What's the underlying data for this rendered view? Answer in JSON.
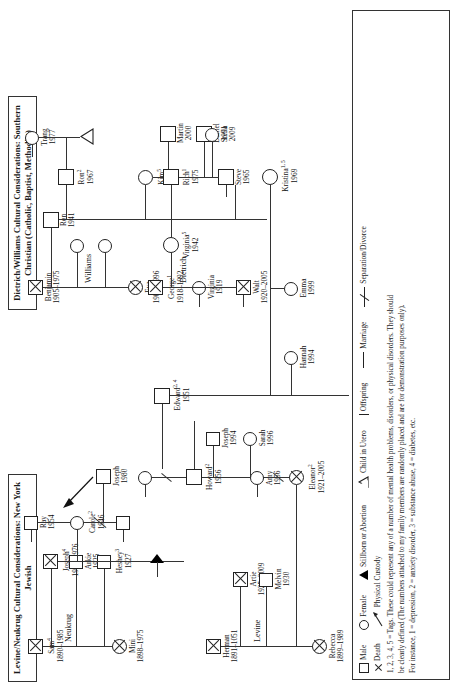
{
  "figure": {
    "type": "genogram",
    "orientation": "landscape-rotated-90ccw",
    "titles": {
      "jewish": "Levine/Neukrug Cultural Considerations: New York Jewish",
      "christian_line1": "Dietrich/Williams Cultural Considerations: Southern",
      "christian_line2": "Christian (Catholic, Baptist, Methodist)"
    }
  },
  "legend": {
    "items": [
      {
        "icon": "square-icon",
        "label": "Male"
      },
      {
        "icon": "circle-icon",
        "label": "Female"
      },
      {
        "icon": "filled-triangle-icon",
        "label": "Stillborn or Abortion"
      },
      {
        "icon": "open-triangle-icon",
        "label": "Child in Utero"
      },
      {
        "icon": "vertical-bar-icon",
        "label": "Offspring"
      },
      {
        "icon": "horizontal-line-icon",
        "label": "Marriage"
      },
      {
        "icon": "x-icon",
        "label": "Death"
      },
      {
        "icon": "arrow-icon",
        "label": "Physical Custody"
      },
      {
        "icon": "slashed-line-icon",
        "label": "Separation/Divorce"
      }
    ],
    "note_line1": "1, 2, 3, 4, 5 = Tags. These could represent any of a number of mental health problems, disorders, or physical disorders. They should",
    "note_line2": "be clearly defined (The numbers attached to my family members are randomly placed and are for demonstration purposes only).",
    "note_line3": "For instance, 1 = depression, 2 = anxiety disorder, 3 = substance abuse, 4 = diabetes, etc."
  },
  "families": {
    "neukrug": {
      "label": "Neukrug"
    },
    "levine": {
      "label": "Levine"
    },
    "williams": {
      "label": "Williams"
    },
    "dietrich": {
      "label": "Dietrich"
    }
  },
  "people": {
    "sam": {
      "name": "Sam",
      "tags": "4",
      "years": "1890–1985",
      "sex": "male",
      "dead": true
    },
    "mini": {
      "name": "Mini",
      "tags": "",
      "years": "1898–1975",
      "sex": "female",
      "dead": true
    },
    "arkie": {
      "name": "Arkie",
      "tags": "",
      "years": "1925",
      "sex": "male",
      "dead": false
    },
    "heshey": {
      "name": "Heshey",
      "tags": "3",
      "years": "1927",
      "sex": "male",
      "dead": false
    },
    "joseph_sr": {
      "name": "Joseph",
      "tags": "4",
      "years": "1919–1976",
      "sex": "male",
      "dead": true
    },
    "ray": {
      "name": "Ray",
      "tags": "",
      "years": "1954",
      "sex": "male",
      "dead": false
    },
    "carole": {
      "name": "Carole",
      "tags": "2",
      "years": "1946",
      "sex": "female",
      "dead": false
    },
    "joseph_jr": {
      "name": "Joseph",
      "tags": "",
      "years": "1980",
      "sex": "male",
      "dead": false
    },
    "herman": {
      "name": "Herman",
      "tags": "",
      "years": "1891–1051",
      "sex": "male",
      "dead": true
    },
    "rebecca": {
      "name": "Rebecca",
      "tags": "",
      "years": "1899–1989",
      "sex": "female",
      "dead": true
    },
    "artie": {
      "name": "Artie",
      "tags": "",
      "years": "1925–2009",
      "sex": "male",
      "dead": true
    },
    "melvin": {
      "name": "Melvin",
      "tags": "",
      "years": "1930",
      "sex": "male",
      "dead": false
    },
    "eleanor": {
      "name": "Eleanor",
      "tags": "2",
      "years": "1921–2005",
      "sex": "female",
      "dead": true
    },
    "howard": {
      "name": "Howard",
      "tags": "2",
      "years": "1956",
      "sex": "male",
      "dead": false
    },
    "amy": {
      "name": "Amy",
      "tags": "",
      "years": "1956",
      "sex": "female",
      "dead": false
    },
    "joseph94": {
      "name": "Joseph",
      "tags": "",
      "years": "1994",
      "sex": "male",
      "dead": false
    },
    "sarah": {
      "name": "Sarah",
      "tags": "",
      "years": "1996",
      "sex": "female",
      "dead": false
    },
    "edward": {
      "name": "Edward",
      "tags": "2, 4",
      "years": "1951",
      "sex": "male",
      "dead": false
    },
    "hannah": {
      "name": "Hannah",
      "tags": "",
      "years": "1994",
      "sex": "female",
      "dead": false
    },
    "benjamin": {
      "name": "Benjamin",
      "tags": "",
      "years": "1905–1975",
      "sex": "male",
      "dead": true
    },
    "eva": {
      "name": "Eva",
      "tags": "",
      "years": "1908–1996",
      "sex": "female",
      "dead": true
    },
    "ron": {
      "name": "Ron",
      "tags": "",
      "years": "1941",
      "sex": "male",
      "dead": false
    },
    "ron2": {
      "name": "Ron",
      "tags": "2",
      "years": "1967",
      "sex": "male",
      "dead": false
    },
    "trang": {
      "name": "Trang",
      "tags": "",
      "years": "1977",
      "sex": "female",
      "dead": false
    },
    "kim": {
      "name": "Kim",
      "tags": "5",
      "years": "1965",
      "sex": "female",
      "dead": false
    },
    "steve": {
      "name": "Steve",
      "tags": "",
      "years": "1965",
      "sex": "male",
      "dead": false
    },
    "martin": {
      "name": "Martin",
      "tags": "",
      "years": "2000",
      "sex": "male",
      "dead": false
    },
    "daniel": {
      "name": "Daniel",
      "tags": "",
      "years": "1991",
      "sex": "male",
      "dead": false
    },
    "kristina": {
      "name": "Kristina",
      "tags": "1, 5",
      "years": "1969",
      "sex": "female",
      "dead": false
    },
    "emma": {
      "name": "Emma",
      "tags": "",
      "years": "1999",
      "sex": "female",
      "dead": false
    },
    "walt": {
      "name": "Walt",
      "tags": "",
      "years": "1920–2005",
      "sex": "male",
      "dead": true
    },
    "virginia": {
      "name": "Virginia",
      "tags": "",
      "years": "1919",
      "sex": "female",
      "dead": false
    },
    "george": {
      "name": "George",
      "tags": "1",
      "years": "1918–1992",
      "sex": "male",
      "dead": true
    },
    "virginia5": {
      "name": "Virginia",
      "tags": "5",
      "years": "1942",
      "sex": "female",
      "dead": false
    },
    "rich": {
      "name": "Rich",
      "tags": "1",
      "years": "1975",
      "sex": "male",
      "dead": false
    },
    "stella": {
      "name": "Stella",
      "tags": "",
      "years": "2009",
      "sex": "female",
      "dead": false
    }
  }
}
